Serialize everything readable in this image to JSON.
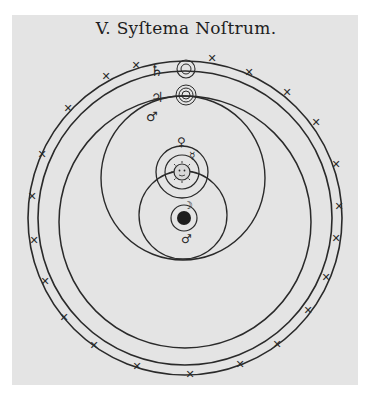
{
  "title": "V. Syſtema Noſtrum.",
  "colors": {
    "paper": "#e4e4e4",
    "ink": "#2a2a2a",
    "background": "#ffffff"
  },
  "diagram": {
    "type": "geoheliocentric-cosmology",
    "center": "earth",
    "bodies": [
      {
        "name": "Earth",
        "symbol": "●"
      },
      {
        "name": "Moon",
        "symbol": "☽"
      },
      {
        "name": "Sun",
        "symbol": "☉"
      },
      {
        "name": "Mercury",
        "symbol": "☿"
      },
      {
        "name": "Venus",
        "symbol": "♀"
      },
      {
        "name": "Mars",
        "symbol": "♂"
      },
      {
        "name": "Jupiter",
        "symbol": "♃"
      },
      {
        "name": "Saturn",
        "symbol": "♄"
      }
    ],
    "outer_ring": "fixed-stars",
    "star_marker": "✕"
  },
  "labels": {
    "saturn": "♄",
    "jupiter": "♃",
    "mars_upper": "♂",
    "mars_lower": "♂",
    "venus": "♀",
    "mercury": "☿",
    "moon": "☽"
  }
}
